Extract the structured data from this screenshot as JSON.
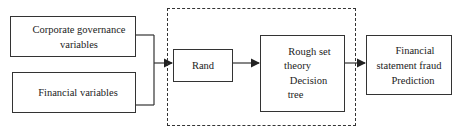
{
  "diagram": {
    "type": "flowchart",
    "nodes": {
      "corporate_governance": {
        "line1": "Corporate governance",
        "line2": "variables"
      },
      "financial_variables": {
        "label": "Financial variables"
      },
      "rand": {
        "label": "Rand"
      },
      "model": {
        "line1": "Rough set",
        "line2": "theory",
        "line3": "Decision",
        "line4": "tree"
      },
      "output": {
        "line1": "Financial",
        "line2": "statement fraud",
        "line3": "Prediction"
      }
    },
    "edges": [
      {
        "from": "corporate_governance",
        "to": "rand"
      },
      {
        "from": "financial_variables",
        "to": "rand"
      },
      {
        "from": "rand",
        "to": "model"
      },
      {
        "from": "model",
        "to": "output"
      }
    ],
    "group": {
      "style": "dashed",
      "contains": [
        "rand",
        "model"
      ]
    },
    "colors": {
      "stroke": "#333333",
      "background": "#ffffff",
      "text": "#222222"
    }
  }
}
